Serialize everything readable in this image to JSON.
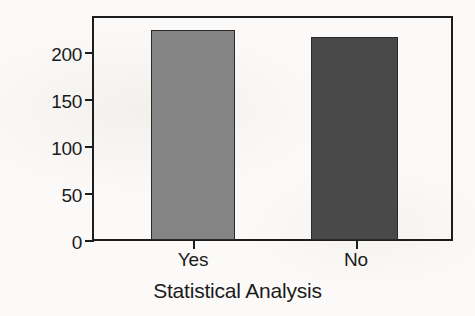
{
  "chart_data": {
    "type": "bar",
    "title": "",
    "xlabel": "Statistical Analysis",
    "ylabel": "Number of Articles",
    "categories": [
      "Yes",
      "No"
    ],
    "values": [
      227,
      220
    ],
    "series": [
      {
        "name": "Number of Articles",
        "values": [
          227,
          220
        ]
      }
    ],
    "ylim": [
      0,
      240
    ],
    "yticks": [
      0,
      50,
      100,
      150,
      200
    ],
    "ytick_labels": [
      "0",
      "50",
      "100",
      "150",
      "200"
    ],
    "grid": false,
    "legend": "none",
    "bar_colors": [
      "#848484",
      "#494949"
    ],
    "bar_edge_color": "#2a2a2a",
    "axis_color": "#1d1d1d",
    "background_color": "#fbfaf8",
    "text_color": "#1b1b1b"
  }
}
